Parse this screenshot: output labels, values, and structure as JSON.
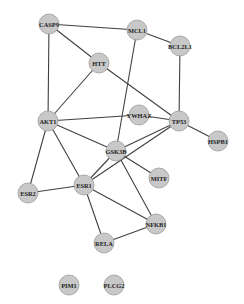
{
  "diagram": {
    "type": "protein-protein interaction network",
    "node_color": "#c8c8c8",
    "edge_color": "#404040",
    "background": "#ffffff",
    "node_radius": 10,
    "nodes": [
      {
        "id": "CASP9",
        "label": "CASP9",
        "x": 49,
        "y": 24
      },
      {
        "id": "MCL1",
        "label": "MCL1",
        "x": 137,
        "y": 30
      },
      {
        "id": "BCL2L1",
        "label": "BCL2L1",
        "x": 180,
        "y": 46
      },
      {
        "id": "HTT",
        "label": "HTT",
        "x": 99,
        "y": 63
      },
      {
        "id": "AKT1",
        "label": "AKT1",
        "x": 48,
        "y": 121
      },
      {
        "id": "YWHAZ",
        "label": "YWHAZ",
        "x": 139,
        "y": 115
      },
      {
        "id": "TP53",
        "label": "TP53",
        "x": 179,
        "y": 121
      },
      {
        "id": "HSPB1",
        "label": "HSPB1",
        "x": 218,
        "y": 141
      },
      {
        "id": "GSK3B",
        "label": "GSK3B",
        "x": 116,
        "y": 151
      },
      {
        "id": "MITF",
        "label": "MITF",
        "x": 159,
        "y": 178
      },
      {
        "id": "ESR2",
        "label": "ESR2",
        "x": 28,
        "y": 193
      },
      {
        "id": "ESR1",
        "label": "ESR1",
        "x": 84,
        "y": 185
      },
      {
        "id": "NFKB1",
        "label": "NFKB1",
        "x": 156,
        "y": 224
      },
      {
        "id": "RELA",
        "label": "RELA",
        "x": 104,
        "y": 243
      },
      {
        "id": "PIM1",
        "label": "PIM1",
        "x": 69,
        "y": 285
      },
      {
        "id": "PLCG2",
        "label": "PLCG2",
        "x": 114,
        "y": 285
      }
    ],
    "edges": [
      [
        "CASP9",
        "MCL1"
      ],
      [
        "CASP9",
        "HTT"
      ],
      [
        "CASP9",
        "AKT1"
      ],
      [
        "MCL1",
        "BCL2L1"
      ],
      [
        "MCL1",
        "GSK3B"
      ],
      [
        "BCL2L1",
        "TP53"
      ],
      [
        "HTT",
        "AKT1"
      ],
      [
        "HTT",
        "TP53"
      ],
      [
        "AKT1",
        "YWHAZ"
      ],
      [
        "AKT1",
        "GSK3B"
      ],
      [
        "AKT1",
        "ESR2"
      ],
      [
        "AKT1",
        "ESR1"
      ],
      [
        "YWHAZ",
        "TP53"
      ],
      [
        "TP53",
        "HSPB1"
      ],
      [
        "TP53",
        "GSK3B"
      ],
      [
        "TP53",
        "ESR1"
      ],
      [
        "GSK3B",
        "ESR1"
      ],
      [
        "GSK3B",
        "MITF"
      ],
      [
        "GSK3B",
        "NFKB1"
      ],
      [
        "ESR2",
        "ESR1"
      ],
      [
        "ESR1",
        "NFKB1"
      ],
      [
        "ESR1",
        "RELA"
      ],
      [
        "NFKB1",
        "RELA"
      ]
    ]
  }
}
